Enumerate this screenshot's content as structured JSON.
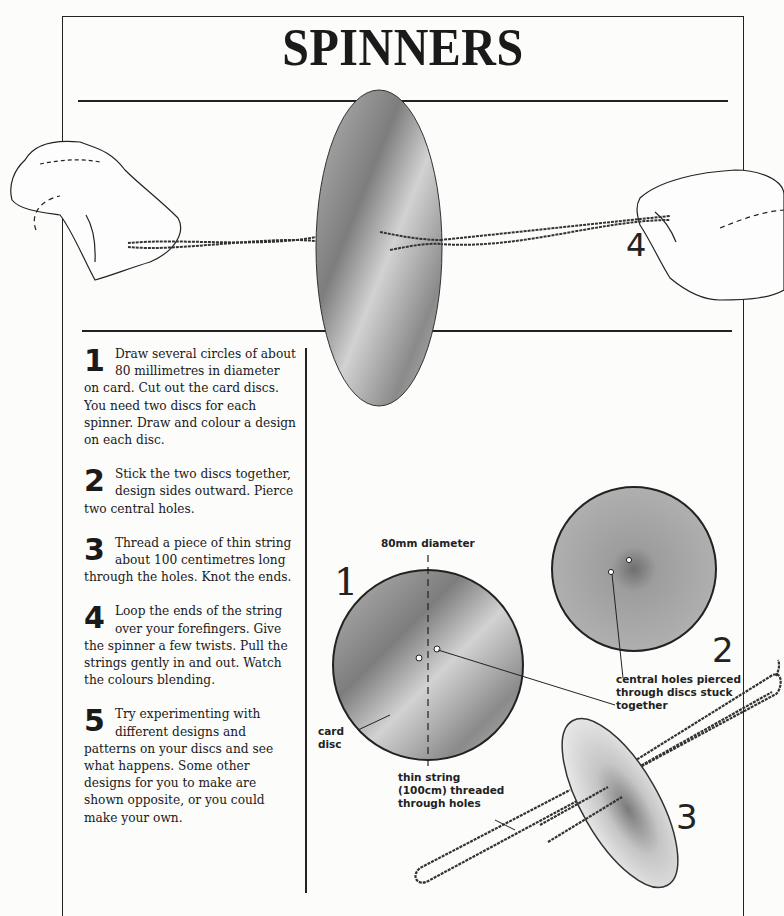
{
  "page": {
    "title": "SPINNERS",
    "hero_step_number": "4"
  },
  "steps": [
    {
      "number": "1",
      "text": "Draw several circles of about 80 millimetres in diameter on card. Cut out the card discs. You need two discs for each spinner. Draw and colour a design on each disc."
    },
    {
      "number": "2",
      "text": "Stick the two discs together, design sides outward. Pierce two central holes."
    },
    {
      "number": "3",
      "text": "Thread a piece of thin string about 100 centimetres long through the holes. Knot the ends."
    },
    {
      "number": "4",
      "text": "Loop the ends of the string over your forefingers. Give the spinner a few twists. Pull the strings gently in and out. Watch the colours blending."
    },
    {
      "number": "5",
      "text": "Try experimenting with different designs and patterns on your discs and see what happens. Some other designs for you to make are shown opposite, or you could make your own."
    }
  ],
  "diagram": {
    "disc1": {
      "number": "1",
      "diameter_label": "80mm diameter",
      "card_label_line1": "card",
      "card_label_line2": "disc"
    },
    "disc2": {
      "number": "2",
      "holes_label_line1": "central holes pierced",
      "holes_label_line2": "through discs stuck",
      "holes_label_line3": "together"
    },
    "disc3": {
      "number": "3",
      "string_label_line1": "thin string",
      "string_label_line2": "(100cm) threaded",
      "string_label_line3": "through holes"
    }
  }
}
